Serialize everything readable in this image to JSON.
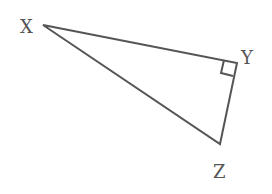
{
  "diagram": {
    "type": "right-triangle",
    "stroke_color": "#555555",
    "label_color": "#555555",
    "vertices": [
      {
        "name": "X",
        "x": 43,
        "y": 25,
        "label_x": 20,
        "label_y": 33
      },
      {
        "name": "Y",
        "x": 237,
        "y": 63,
        "label_x": 241,
        "label_y": 64
      },
      {
        "name": "Z",
        "x": 220,
        "y": 144,
        "label_x": 213,
        "label_y": 178
      }
    ],
    "right_angle_at": "Y"
  }
}
